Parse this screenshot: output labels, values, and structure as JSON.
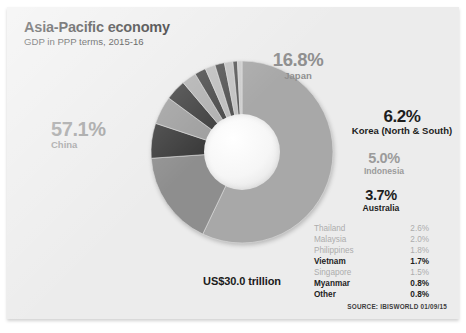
{
  "header": {
    "title": "Asia-Pacific economy",
    "subtitle": "GDP in PPP terms, 2015-16"
  },
  "center_total": "US$30.0 trillion",
  "source": "SOURCE: IBISWORLD 01/09/15",
  "callouts": {
    "china": {
      "pct": "57.1%",
      "name": "China"
    },
    "japan": {
      "pct": "16.8%",
      "name": "Japan"
    },
    "korea": {
      "pct": "6.2%",
      "name": "Korea (North & South)"
    },
    "indonesia": {
      "pct": "5.0%",
      "name": "Indonesia"
    },
    "australia": {
      "pct": "3.7%",
      "name": "Australia"
    }
  },
  "legend": {
    "rows": [
      {
        "name": "Thailand",
        "value": "2.6%",
        "emphasis": "dim"
      },
      {
        "name": "Malaysia",
        "value": "2.0%",
        "emphasis": "dim"
      },
      {
        "name": "Philippines",
        "value": "1.8%",
        "emphasis": "dim"
      },
      {
        "name": "Vietnam",
        "value": "1.7%",
        "emphasis": "bold"
      },
      {
        "name": "Singapore",
        "value": "1.5%",
        "emphasis": "dim"
      },
      {
        "name": "Myanmar",
        "value": "0.8%",
        "emphasis": "bold"
      },
      {
        "name": "Other",
        "value": "0.8%",
        "emphasis": "bold"
      }
    ]
  },
  "chart_data": {
    "type": "pie",
    "title": "Asia-Pacific economy",
    "subtitle": "GDP in PPP terms, 2015-16",
    "unit": "percent of total GDP (PPP)",
    "total_label": "US$30.0 trillion",
    "donut": true,
    "start_angle_deg": 0,
    "direction": "clockwise",
    "legend_position": "right",
    "grid": false,
    "categories": [
      "China",
      "Japan",
      "Korea (North & South)",
      "Indonesia",
      "Australia",
      "Thailand",
      "Malaysia",
      "Philippines",
      "Vietnam",
      "Singapore",
      "Myanmar",
      "Other"
    ],
    "values": [
      57.1,
      16.8,
      6.2,
      5.0,
      3.7,
      2.6,
      2.0,
      1.8,
      1.7,
      1.5,
      0.8,
      0.8
    ],
    "colors": [
      "#a8a8a8",
      "#8e8e8e",
      "#3a3a3a",
      "#9e9e9e",
      "#3f3f3f",
      "#b0b0b0",
      "#4a4a4a",
      "#bdbdbd",
      "#525252",
      "#c2c2c2",
      "#5a5a5a",
      "#cccccc"
    ],
    "slices": [
      {
        "label": "China",
        "value": 57.1,
        "color": "#a8a8a8"
      },
      {
        "label": "Japan",
        "value": 16.8,
        "color": "#8e8e8e"
      },
      {
        "label": "Korea (North & South)",
        "value": 6.2,
        "color": "#3a3a3a"
      },
      {
        "label": "Indonesia",
        "value": 5.0,
        "color": "#9e9e9e"
      },
      {
        "label": "Australia",
        "value": 3.7,
        "color": "#3f3f3f"
      },
      {
        "label": "Thailand",
        "value": 2.6,
        "color": "#b0b0b0"
      },
      {
        "label": "Malaysia",
        "value": 2.0,
        "color": "#4a4a4a"
      },
      {
        "label": "Philippines",
        "value": 1.8,
        "color": "#bdbdbd"
      },
      {
        "label": "Vietnam",
        "value": 1.7,
        "color": "#525252"
      },
      {
        "label": "Singapore",
        "value": 1.5,
        "color": "#c2c2c2"
      },
      {
        "label": "Myanmar",
        "value": 0.8,
        "color": "#5a5a5a"
      },
      {
        "label": "Other",
        "value": 0.8,
        "color": "#cccccc"
      }
    ]
  },
  "palette": {
    "background": "#ececec",
    "page": "#ffffff",
    "text_dark": "#1d1d1d",
    "text_dim": "#9b9b9b"
  }
}
